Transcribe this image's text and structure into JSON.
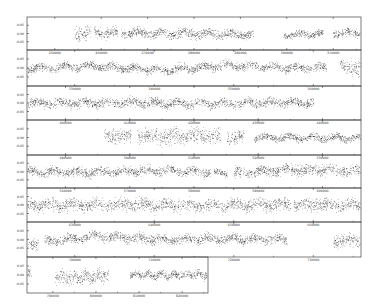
{
  "chart_data": {
    "type": "scatter",
    "title": "",
    "xlabel": "",
    "ylabel": "",
    "grid": false,
    "legend": null,
    "panels": [
      {
        "box": [
          27,
          17,
          361,
          50
        ],
        "yticks": [
          "0.05",
          "0.00",
          "-0.05"
        ],
        "xticks": [
          "250000",
          "260000",
          "270000",
          "280000",
          "290000",
          "300000",
          "310000"
        ],
        "segments": [
          [
            0.14,
            0.19,
            0.9
          ],
          [
            0.2,
            0.27,
            0.7
          ],
          [
            0.28,
            0.68,
            0.6
          ],
          [
            0.77,
            0.89,
            0.5
          ],
          [
            0.92,
            1.0,
            0.55
          ]
        ],
        "trend": [
          0.0,
          0.1,
          0.0,
          -0.15,
          0.1
        ]
      },
      {
        "box": [
          27,
          50,
          361,
          86
        ],
        "yticks": [
          "0.05",
          "0.00",
          "-0.05"
        ],
        "xticks": [
          "330000",
          "340000",
          "350000",
          "360000"
        ],
        "segments": [
          [
            0.0,
            0.9,
            0.5
          ],
          [
            0.94,
            1.0,
            0.9
          ]
        ],
        "trend": [
          0.0,
          0.2,
          -0.2,
          0.25,
          0.0,
          0.1
        ]
      },
      {
        "box": [
          27,
          86,
          361,
          120
        ],
        "yticks": [
          "0.05",
          "0.00",
          "-0.05"
        ],
        "xticks": [
          "400000",
          "410000",
          "420000",
          "430000",
          "440000"
        ],
        "segments": [
          [
            0.0,
            0.86,
            0.6
          ]
        ],
        "trend": [
          0.0,
          0.05,
          -0.05,
          0.05,
          0.0
        ]
      },
      {
        "box": [
          27,
          120,
          361,
          155
        ],
        "yticks": [
          "0.05",
          "0.00",
          "-0.05"
        ],
        "xticks": [
          "490000",
          "500000",
          "510000",
          "520000",
          "530000"
        ],
        "segments": [
          [
            0.23,
            0.31,
            0.9
          ],
          [
            0.33,
            0.58,
            1.0
          ],
          [
            0.6,
            0.65,
            0.9
          ],
          [
            0.68,
            1.0,
            0.45
          ]
        ],
        "trend": [
          0.0,
          0.1,
          0.15,
          0.0,
          -0.05
        ]
      },
      {
        "box": [
          27,
          155,
          361,
          188
        ],
        "yticks": [
          "0.05",
          "0.00",
          "-0.05"
        ],
        "xticks": [
          "560000",
          "570000",
          "580000",
          "590000",
          "600000"
        ],
        "segments": [
          [
            0.0,
            0.55,
            0.6
          ],
          [
            0.56,
            0.6,
            0.4
          ],
          [
            0.62,
            1.0,
            0.7
          ]
        ],
        "trend": [
          0.0,
          -0.05,
          0.1,
          -0.15,
          0.2,
          0.05
        ]
      },
      {
        "box": [
          27,
          188,
          361,
          222
        ],
        "yticks": [
          "0.05",
          "0.00",
          "-0.05"
        ],
        "xticks": [
          "630000",
          "640000",
          "650000",
          "660000"
        ],
        "segments": [
          [
            0.0,
            0.79,
            0.8
          ],
          [
            0.8,
            1.0,
            0.8
          ]
        ],
        "trend": [
          0.0,
          0.05,
          -0.05,
          0.05,
          0.0
        ]
      },
      {
        "box": [
          27,
          222,
          361,
          257
        ],
        "yticks": [
          "0.05",
          "0.00",
          "-0.05"
        ],
        "xticks": [
          "700000",
          "710000",
          "720000",
          "730000"
        ],
        "segments": [
          [
            0.0,
            0.03,
            0.7
          ],
          [
            0.05,
            0.78,
            0.6
          ],
          [
            0.92,
            1.0,
            0.8
          ]
        ],
        "trend": [
          -0.4,
          0.35,
          0.0,
          0.05,
          0.0,
          -0.1
        ]
      },
      {
        "box": [
          27,
          257,
          208,
          293
        ],
        "yticks": [
          "0.05",
          "0.00",
          "-0.05"
        ],
        "xticks": [
          "790000",
          "800000",
          "810000",
          "820000"
        ],
        "segments": [
          [
            0.0,
            0.02,
            0.8
          ],
          [
            0.15,
            0.45,
            0.8
          ],
          [
            0.57,
            1.0,
            0.5
          ]
        ],
        "trend": [
          0.2,
          -0.3,
          0.1,
          0.0,
          0.05
        ]
      }
    ]
  },
  "render": {
    "axis_color": "#222222",
    "point_color": "#111111",
    "background": "#ffffff"
  }
}
